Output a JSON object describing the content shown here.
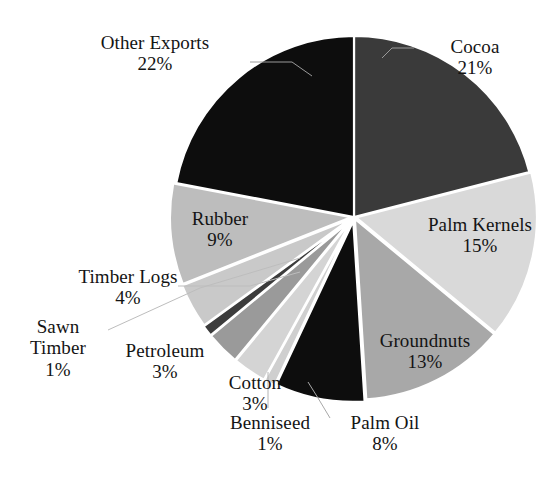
{
  "chart_data": {
    "type": "pie",
    "title": "",
    "subtitle": "",
    "xlabel": "",
    "ylabel": "",
    "legend_position": "none",
    "grid": false,
    "labels_show_percent": true,
    "total_percent": 100,
    "start_angle_deg": 0,
    "direction": "clockwise",
    "categories": [
      "Cocoa",
      "Palm Kernels",
      "Groundnuts",
      "Palm Oil",
      "Benniseed",
      "Cotton",
      "Petroleum",
      "Sawn Timber",
      "Timber Logs",
      "Rubber",
      "Other Exports"
    ],
    "values": [
      21,
      15,
      13,
      8,
      1,
      3,
      3,
      1,
      4,
      9,
      22
    ],
    "slice_colors": [
      "#3a3a3a",
      "#d9d9d9",
      "#a8a8a8",
      "#0d0d0d",
      "#cfcfcf",
      "#d4d4d4",
      "#9a9a9a",
      "#3c3c3c",
      "#c9c9c9",
      "#bdbdbd",
      "#0d0d0d"
    ],
    "slices": [
      {
        "label": "Cocoa",
        "value": 21,
        "percent_text": "21%",
        "color": "#3a3a3a"
      },
      {
        "label": "Palm Kernels",
        "value": 15,
        "percent_text": "15%",
        "color": "#d9d9d9"
      },
      {
        "label": "Groundnuts",
        "value": 13,
        "percent_text": "13%",
        "color": "#a8a8a8"
      },
      {
        "label": "Palm Oil",
        "value": 8,
        "percent_text": "8%",
        "color": "#0d0d0d"
      },
      {
        "label": "Benniseed",
        "value": 1,
        "percent_text": "1%",
        "color": "#cfcfcf"
      },
      {
        "label": "Cotton",
        "value": 3,
        "percent_text": "3%",
        "color": "#d4d4d4"
      },
      {
        "label": "Petroleum",
        "value": 3,
        "percent_text": "3%",
        "color": "#9a9a9a"
      },
      {
        "label": "Sawn Timber",
        "value": 1,
        "percent_text": "1%",
        "color": "#3c3c3c"
      },
      {
        "label": "Timber Logs",
        "value": 4,
        "percent_text": "4%",
        "color": "#c9c9c9"
      },
      {
        "label": "Rubber",
        "value": 9,
        "percent_text": "9%",
        "color": "#bdbdbd"
      },
      {
        "label": "Other Exports",
        "value": 22,
        "percent_text": "22%",
        "color": "#0d0d0d"
      }
    ]
  },
  "labels": {
    "other_exports": {
      "name": "Other Exports",
      "pct": "22%"
    },
    "cocoa": {
      "name": "Cocoa",
      "pct": "21%"
    },
    "palm_kernels": {
      "name": "Palm Kernels",
      "pct": "15%"
    },
    "groundnuts": {
      "name": "Groundnuts",
      "pct": "13%"
    },
    "palm_oil": {
      "name": "Palm Oil",
      "pct": "8%"
    },
    "benniseed": {
      "name": "Benniseed",
      "pct": "1%"
    },
    "cotton": {
      "name": "Cotton",
      "pct": "3%"
    },
    "petroleum": {
      "name": "Petroleum",
      "pct": "3%"
    },
    "sawn_timber": {
      "name": "Sawn\nTimber",
      "pct": "1%"
    },
    "timber_logs": {
      "name": "Timber Logs",
      "pct": "4%"
    },
    "rubber": {
      "name": "Rubber",
      "pct": "9%"
    }
  },
  "style": {
    "background": "#ffffff",
    "text_color": "#141414",
    "separator_color": "#ffffff"
  }
}
